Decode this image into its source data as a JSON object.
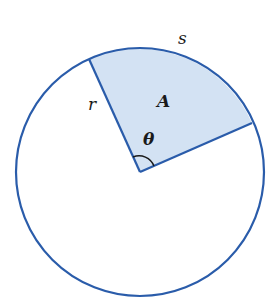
{
  "diagram": {
    "labels": {
      "arc": "s",
      "radius": "r",
      "area": "A",
      "angle": "θ"
    },
    "colors": {
      "stroke": "#2a5caa",
      "sector_fill": "#d3e2f3",
      "text": "#1a1a1a",
      "background": "#ffffff"
    },
    "geometry": {
      "center": [
        140,
        172
      ],
      "radius": 124,
      "sector_start_point": [
        89,
        58
      ],
      "sector_end_point": [
        252,
        123
      ]
    }
  }
}
